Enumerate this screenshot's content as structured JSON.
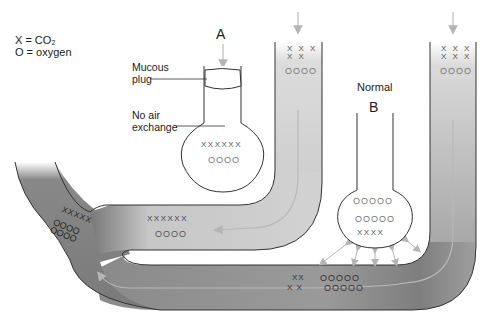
{
  "legend": {
    "co2": "X = CO₂",
    "oxygen": "O = oxygen"
  },
  "alveolus_a": {
    "label": "A",
    "mucous_plug_label_1": "Mucous",
    "mucous_plug_label_2": "plug",
    "no_air_label_1": "No air",
    "no_air_label_2": "exchange",
    "co2": "XXXXXX",
    "o2": "OOOO"
  },
  "alveolus_b": {
    "title": "Normal",
    "label": "B",
    "o2_row1": "OOOOO",
    "o2_row2": "OOOOO",
    "co2": "XXXX"
  },
  "left_vessel": {
    "co2_row1": "X X X",
    "co2_row2": "X X",
    "o2": "OOOO"
  },
  "right_vessel": {
    "co2_row1": "X X X",
    "co2_row2": "X X X",
    "o2": "OOOO"
  },
  "middle_vessel": {
    "co2": "XXXXXX",
    "o2": "OOOO"
  },
  "bottom_vessel": {
    "co2_row1": "XX",
    "co2_row2": "X X",
    "o2_row1": "OOOOO",
    "o2_row2": "OOOOO"
  },
  "mixed_vessel": {
    "co2": "XXXXX",
    "o2_row1": "OOOO",
    "o2_row2": "OOOO"
  },
  "colors": {
    "vessel_light": "#c9c9c9",
    "vessel_dark": "#7a7a7a",
    "arrow": "#b5b5b5",
    "outline": "#333333"
  }
}
